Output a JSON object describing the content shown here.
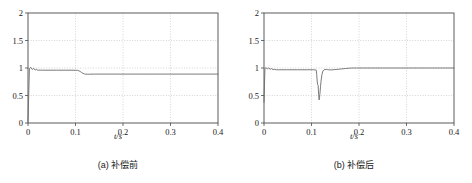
{
  "figure": {
    "panel_count": 2
  },
  "panels": [
    {
      "caption": "(a) 补偿前",
      "xlabel": "t/s"
    },
    {
      "caption": "(b) 补偿后",
      "xlabel": "t/s"
    }
  ],
  "chart_data": [
    {
      "type": "line",
      "title": "(a) 补偿前",
      "xlabel": "t/s",
      "ylabel": "",
      "xlim": [
        0,
        0.4
      ],
      "ylim": [
        0,
        2
      ],
      "xticks": [
        0,
        0.1,
        0.2,
        0.3,
        0.4
      ],
      "xticklabels": [
        "0",
        "0.1",
        "0.2",
        "0.3",
        "0.4"
      ],
      "yticks": [
        0,
        0.5,
        1,
        1.5,
        2
      ],
      "yticklabels": [
        "0",
        "0.5",
        "1",
        "1.5",
        "2"
      ],
      "grid": true,
      "grid_style": "dotted",
      "grid_color": "#b9b9b9",
      "legend": false,
      "line_color": "#6b6b6b",
      "line_width": 0.9,
      "series": [
        {
          "name": "voltage-before-compensation",
          "x": [
            0.0,
            0.003,
            0.006,
            0.009,
            0.012,
            0.015,
            0.018,
            0.021,
            0.025,
            0.03,
            0.04,
            0.06,
            0.08,
            0.1,
            0.104,
            0.107,
            0.11,
            0.113,
            0.116,
            0.119,
            0.122,
            0.126,
            0.13,
            0.14,
            0.16,
            0.2,
            0.25,
            0.3,
            0.35,
            0.4
          ],
          "y": [
            0.02,
            0.995,
            1.01,
            0.972,
            0.995,
            0.962,
            0.975,
            0.958,
            0.962,
            0.96,
            0.96,
            0.96,
            0.96,
            0.959,
            0.957,
            0.95,
            0.936,
            0.918,
            0.902,
            0.892,
            0.888,
            0.887,
            0.888,
            0.889,
            0.889,
            0.889,
            0.889,
            0.889,
            0.889,
            0.889
          ]
        }
      ]
    },
    {
      "type": "line",
      "title": "(b) 补偿后",
      "xlabel": "t/s",
      "ylabel": "",
      "xlim": [
        0,
        0.4
      ],
      "ylim": [
        0,
        2
      ],
      "xticks": [
        0,
        0.1,
        0.2,
        0.3,
        0.4
      ],
      "xticklabels": [
        "0",
        "0.1",
        "0.2",
        "0.3",
        "0.4"
      ],
      "yticks": [
        0,
        0.5,
        1,
        1.5,
        2
      ],
      "yticklabels": [
        "0",
        "0.5",
        "1",
        "1.5",
        "2"
      ],
      "grid": true,
      "grid_style": "dotted",
      "grid_color": "#b9b9b9",
      "legend": false,
      "line_color": "#6b6b6b",
      "line_width": 0.9,
      "series": [
        {
          "name": "voltage-after-compensation",
          "x": [
            0.0,
            0.002,
            0.004,
            0.007,
            0.01,
            0.013,
            0.016,
            0.019,
            0.022,
            0.026,
            0.03,
            0.05,
            0.07,
            0.09,
            0.105,
            0.108,
            0.11,
            0.111,
            0.112,
            0.113,
            0.114,
            0.1145,
            0.115,
            0.1155,
            0.116,
            0.117,
            0.118,
            0.119,
            0.12,
            0.122,
            0.124,
            0.126,
            0.128,
            0.131,
            0.134,
            0.138,
            0.142,
            0.148,
            0.155,
            0.163,
            0.172,
            0.18,
            0.188,
            0.195,
            0.21,
            0.25,
            0.3,
            0.35,
            0.4
          ],
          "y": [
            0.38,
            0.995,
            1.005,
            0.985,
            1.0,
            0.976,
            0.99,
            0.97,
            0.975,
            0.968,
            0.968,
            0.968,
            0.968,
            0.968,
            0.968,
            0.966,
            0.96,
            0.88,
            0.76,
            0.7,
            0.69,
            0.6,
            0.52,
            0.46,
            0.42,
            0.47,
            0.56,
            0.66,
            0.76,
            0.88,
            0.945,
            0.965,
            0.972,
            0.974,
            0.97,
            0.966,
            0.966,
            0.97,
            0.976,
            0.983,
            0.991,
            0.997,
            1.0,
            1.0,
            1.0,
            1.0,
            1.0,
            1.0,
            1.0
          ]
        }
      ]
    }
  ]
}
